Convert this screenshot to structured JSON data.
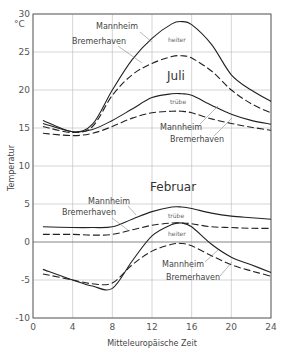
{
  "chart_data": {
    "type": "line",
    "title": "",
    "xlabel": "Mitteleuropäische Zeit",
    "ylabel": "Temperatur",
    "yunit": "°C",
    "xlim": [
      0,
      24
    ],
    "ylim": [
      -10,
      30
    ],
    "xticks": [
      0,
      4,
      8,
      12,
      16,
      20,
      24
    ],
    "yticks": [
      -10,
      -5,
      0,
      5,
      10,
      15,
      20,
      25,
      30
    ],
    "grid": true,
    "x": [
      1,
      4,
      6,
      8,
      10,
      12,
      14,
      15,
      16,
      18,
      20,
      22,
      24
    ],
    "series": [
      {
        "name": "Juli heiter Mannheim",
        "style": "solid",
        "values": [
          16.0,
          14.5,
          15.5,
          20.0,
          24.0,
          26.8,
          28.7,
          29.0,
          28.6,
          26.0,
          22.0,
          20.0,
          18.5
        ]
      },
      {
        "name": "Juli heiter Bremerhaven",
        "style": "dashed",
        "values": [
          15.2,
          14.4,
          15.2,
          19.3,
          22.0,
          23.5,
          24.4,
          24.5,
          24.2,
          22.5,
          20.0,
          18.2,
          17.0
        ]
      },
      {
        "name": "Juli trübe Mannheim",
        "style": "solid",
        "values": [
          15.6,
          14.5,
          14.8,
          16.0,
          17.5,
          19.0,
          19.5,
          19.5,
          19.3,
          18.0,
          16.8,
          16.0,
          15.5
        ]
      },
      {
        "name": "Juli trübe Bremerhaven",
        "style": "dashed",
        "values": [
          14.3,
          14.0,
          14.3,
          15.2,
          16.3,
          17.0,
          17.2,
          17.2,
          17.0,
          16.2,
          15.6,
          15.1,
          14.7
        ]
      },
      {
        "name": "Februar trübe Mannheim",
        "style": "solid",
        "values": [
          2.0,
          1.9,
          1.9,
          2.0,
          3.0,
          4.0,
          4.6,
          4.6,
          4.4,
          3.8,
          3.4,
          3.2,
          3.0
        ]
      },
      {
        "name": "Februar trübe Bremerhaven",
        "style": "dashed",
        "values": [
          1.0,
          1.0,
          0.9,
          1.0,
          1.6,
          2.2,
          2.5,
          2.5,
          2.4,
          2.0,
          1.9,
          1.8,
          1.8
        ]
      },
      {
        "name": "Februar heiter Mannheim",
        "style": "solid",
        "values": [
          -3.6,
          -5.0,
          -5.8,
          -6.1,
          -2.5,
          0.8,
          2.3,
          2.5,
          2.0,
          -0.3,
          -2.0,
          -3.0,
          -4.0
        ]
      },
      {
        "name": "Februar heiter Bremerhaven",
        "style": "dashed",
        "values": [
          -4.2,
          -5.0,
          -5.5,
          -5.4,
          -3.0,
          -1.2,
          -0.3,
          -0.2,
          -0.5,
          -1.8,
          -3.0,
          -3.8,
          -4.5
        ]
      }
    ],
    "annotations": [
      {
        "text": "Mannheim",
        "group": "Juli heiter"
      },
      {
        "text": "Bremerhaven",
        "group": "Juli heiter"
      },
      {
        "text": "heiter",
        "group": "Juli"
      },
      {
        "text": "Juli"
      },
      {
        "text": "trübe",
        "group": "Juli"
      },
      {
        "text": "Mannheim",
        "group": "Juli trübe"
      },
      {
        "text": "Bremerhaven",
        "group": "Juli trübe"
      },
      {
        "text": "Februar"
      },
      {
        "text": "Mannheim",
        "group": "Februar trübe"
      },
      {
        "text": "Bremerhaven",
        "group": "Februar trübe"
      },
      {
        "text": "trübe",
        "group": "Februar"
      },
      {
        "text": "heiter",
        "group": "Februar"
      },
      {
        "text": "Mannheim",
        "group": "Februar heiter"
      },
      {
        "text": "Bremerhaven",
        "group": "Februar heiter"
      }
    ]
  },
  "labels": {
    "unit": "°C",
    "ylabel": "Temperatur",
    "xlabel": "Mitteleuropäische Zeit",
    "juli": "Juli",
    "februar": "Februar",
    "heiter": "heiter",
    "truebe": "trübe",
    "mannheim": "Mannheim",
    "bremerhaven": "Bremerhaven"
  }
}
